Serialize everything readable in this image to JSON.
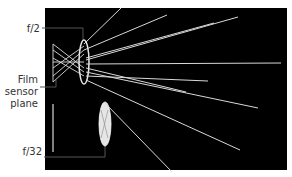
{
  "labels": {
    "aperture_wide": "f/2",
    "sensor_line1": "Film",
    "sensor_line2": "sensor",
    "sensor_line3": "plane",
    "aperture_narrow": "f/32"
  },
  "colors": {
    "background": "#000000",
    "rays": "#d9d9d9",
    "lens": "#e6e6e6",
    "leader": "#555555",
    "text": "#333333"
  }
}
